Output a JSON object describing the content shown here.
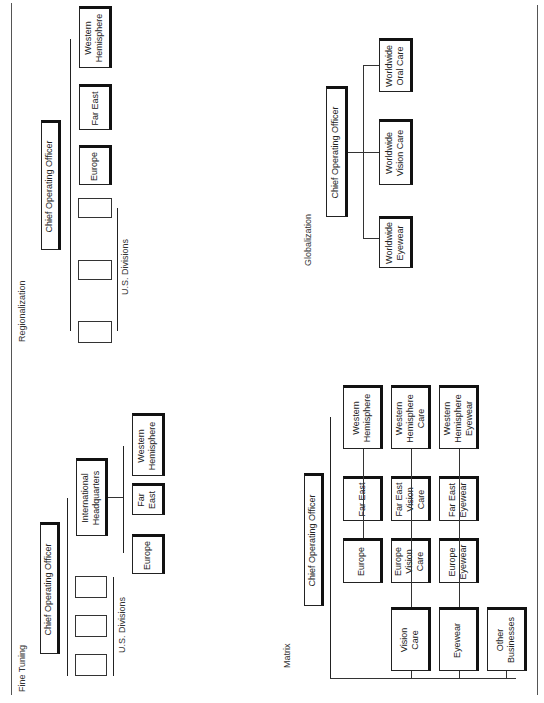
{
  "page": {
    "border_color": "#555555",
    "box_border_color": "#111111"
  },
  "sections": {
    "regionalization": {
      "title": "Regionalization",
      "coo": "Chief Operating Officer",
      "us_divisions_label": "U.S. Divisions",
      "regions": [
        "Europe",
        "Far East",
        "Western\nHemisphere"
      ]
    },
    "globalization": {
      "title": "Globalization",
      "coo": "Chief Operating Officer",
      "units": [
        "Worldwide\nEyewear",
        "Worldwide\nVision Care",
        "Worldwide\nOral Care"
      ]
    },
    "fine_tuning": {
      "title": "Fine Tuning",
      "coo": "Chief Operating Officer",
      "us_divisions_label": "U.S. Divisions",
      "international_hq": "International\nHeadquarters",
      "regions": [
        "Europe",
        "Far\nEast",
        "Western\nHemisphere"
      ]
    },
    "matrix": {
      "title": "Matrix",
      "coo": "Chief Operating Officer",
      "business_rows": [
        "Vision\nCare",
        "Eyewear",
        "Other\nBusinesses"
      ],
      "region_headers": [
        "Europe",
        "Far East",
        "Western\nHemisphere"
      ],
      "vision_care_row": [
        "Europe\nVision\nCare",
        "Far East\nVision\nCare",
        "Western\nHemisphere\nCare"
      ],
      "eyewear_row": [
        "Europe\nEyewear",
        "Far East\nEyewear",
        "Western\nHemisphere\nEyewear"
      ]
    }
  }
}
